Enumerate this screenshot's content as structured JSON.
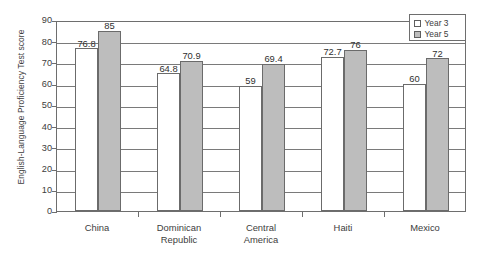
{
  "chart_data": {
    "type": "bar",
    "title": "",
    "xlabel": "",
    "ylabel": "English-Language Proficiency Test score",
    "ylim": [
      0,
      90
    ],
    "ytick_step": 10,
    "yticks": [
      "90",
      "80",
      "70",
      "60",
      "50",
      "40",
      "30",
      "20",
      "10",
      "0"
    ],
    "grid": true,
    "legend_position": "top-right",
    "categories": [
      "China",
      "Dominican\nRepublic",
      "Central\nAmerica",
      "Haiti",
      "Mexico"
    ],
    "series": [
      {
        "name": "Year 3",
        "fill": "#ffffff",
        "values": [
          76.8,
          64.8,
          59,
          72.7,
          60
        ],
        "labels": [
          "76.8",
          "64.8",
          "59",
          "72.7",
          "60"
        ]
      },
      {
        "name": "Year 5",
        "fill": "#bdbdbd",
        "values": [
          85,
          70.9,
          69.4,
          76,
          72
        ],
        "labels": [
          "85",
          "70.9",
          "69.4",
          "76",
          "72"
        ]
      }
    ]
  },
  "legend": {
    "items": [
      {
        "label": "Year 3",
        "swatch": "legend-swatch-year3"
      },
      {
        "label": "Year 5",
        "swatch": "legend-swatch-year5"
      }
    ]
  },
  "axis": {
    "y_title": "English-Language Proficiency Test score"
  }
}
